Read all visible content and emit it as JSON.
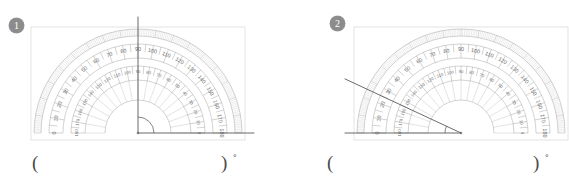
{
  "page": {
    "background": "#ffffff",
    "width": 569,
    "height": 190
  },
  "style": {
    "ink": "#4a4a4a",
    "scale_line": "#9b9b9b",
    "scale_text": "#6b6b6b",
    "band_fill": "#e9e9e9",
    "badge_fill": "#8c8c8c",
    "badge_text": "#ffffff",
    "ray_color": "#5a5a5a"
  },
  "problems": [
    {
      "number": "1",
      "badge_label": "❶",
      "badge_number": "1",
      "protractor": {
        "center_x": 138,
        "center_y": 133,
        "outer_radius": 104,
        "inner_radius": 33,
        "outer_scale_labels": [
          "0",
          "10",
          "20",
          "30",
          "40",
          "50",
          "60",
          "70",
          "80",
          "90",
          "100",
          "110",
          "120",
          "130",
          "140",
          "150",
          "160",
          "170",
          "180"
        ],
        "inner_scale_labels": [
          "180",
          "170",
          "160",
          "150",
          "140",
          "130",
          "120",
          "110",
          "100",
          "90",
          "80",
          "70",
          "60",
          "50",
          "40",
          "30",
          "20",
          "10",
          "0"
        ],
        "tick_major_step": 10,
        "tick_minor_step": 1
      },
      "rays": [
        {
          "name": "baseline-ray",
          "angle_deg": 0,
          "length": 116
        },
        {
          "name": "measured-ray",
          "angle_deg": 90,
          "length": 116
        }
      ],
      "angle_arc_deg": 90,
      "answer": {
        "open_paren": "(",
        "close_paren": ")",
        "degree_symbol": "°",
        "value": ""
      }
    },
    {
      "number": "2",
      "badge_label": "❷",
      "badge_number": "2",
      "protractor": {
        "center_x": 176,
        "center_y": 133,
        "outer_radius": 104,
        "inner_radius": 33,
        "outer_scale_labels": [
          "0",
          "10",
          "20",
          "30",
          "40",
          "50",
          "60",
          "70",
          "80",
          "90",
          "100",
          "110",
          "120",
          "130",
          "140",
          "150",
          "160",
          "170",
          "180"
        ],
        "inner_scale_labels": [
          "180",
          "170",
          "160",
          "150",
          "140",
          "130",
          "120",
          "110",
          "100",
          "90",
          "80",
          "70",
          "60",
          "50",
          "40",
          "30",
          "20",
          "10",
          "0"
        ],
        "tick_major_step": 10,
        "tick_minor_step": 1
      },
      "rays": [
        {
          "name": "baseline-ray",
          "angle_deg": 180,
          "length": 116
        },
        {
          "name": "measured-ray",
          "angle_deg": 155,
          "length": 128
        }
      ],
      "angle_arc_deg": 25,
      "answer": {
        "open_paren": "(",
        "close_paren": ")",
        "degree_symbol": "°",
        "value": ""
      }
    }
  ]
}
